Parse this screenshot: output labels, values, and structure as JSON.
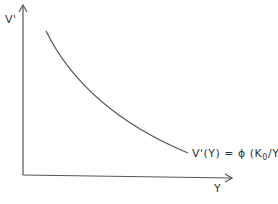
{
  "diagram": {
    "y_axis_label": "V'",
    "x_axis_label": "Y",
    "curve_label_prefix": "V'(Y) = ",
    "curve_label_phi": "ϕ",
    "curve_label_open": " (K",
    "curve_label_sub": "0",
    "curve_label_close": "/Y)",
    "curve": {
      "type": "decreasing convex",
      "description": "downward-sloping convex curve"
    },
    "stroke_color": "#555555"
  }
}
